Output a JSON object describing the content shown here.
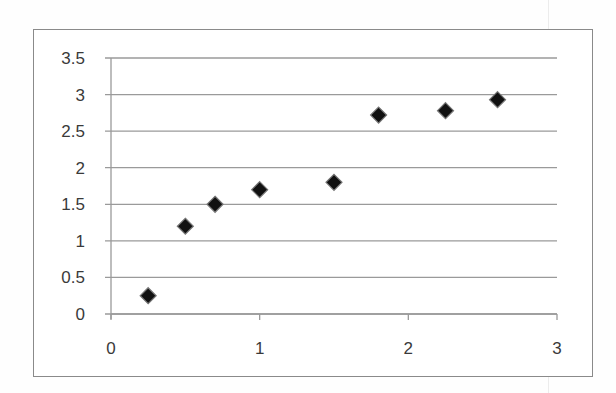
{
  "chart_data": {
    "type": "scatter",
    "title": "",
    "xlabel": "",
    "ylabel": "",
    "xlim": [
      0,
      3
    ],
    "ylim": [
      0,
      3.5
    ],
    "grid": {
      "horizontal": true,
      "vertical": false
    },
    "legend": null,
    "marker": "diamond",
    "marker_color": "#111111",
    "x_ticks": [
      "0",
      "1",
      "2",
      "3"
    ],
    "y_ticks": [
      "0",
      "0.5",
      "1",
      "1.5",
      "2",
      "2.5",
      "3",
      "3.5"
    ],
    "series": [
      {
        "name": "Series1",
        "points": [
          {
            "x": 0.25,
            "y": 0.25
          },
          {
            "x": 0.5,
            "y": 1.2
          },
          {
            "x": 0.7,
            "y": 1.5
          },
          {
            "x": 1.0,
            "y": 1.7
          },
          {
            "x": 1.5,
            "y": 1.8
          },
          {
            "x": 1.8,
            "y": 2.72
          },
          {
            "x": 2.25,
            "y": 2.78
          },
          {
            "x": 2.6,
            "y": 2.93
          }
        ]
      }
    ]
  },
  "layout": {
    "gridline_color": "#9a9a9a",
    "axis_color": "#9a9a9a"
  }
}
